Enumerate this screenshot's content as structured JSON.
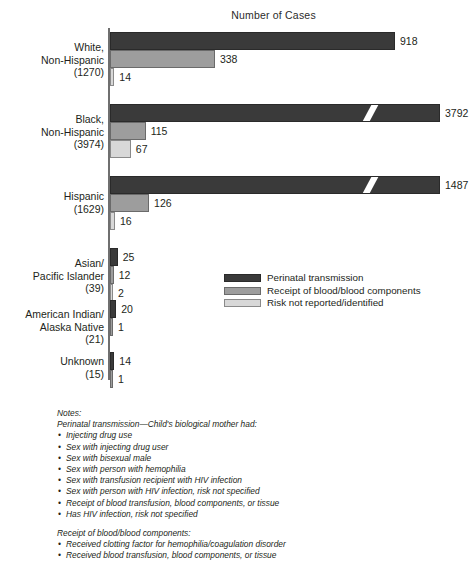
{
  "chart_data": {
    "type": "bar",
    "orientation": "horizontal",
    "title": "Number of Cases",
    "xlabel": "",
    "ylabel": "",
    "grid": false,
    "legend_position": "middle-right",
    "axis_break": true,
    "axis_break_note": "Bars for Black, Non-Hispanic (3792) and Hispanic (1487) perinatal transmission are drawn with a diagonal axis break.",
    "categories": [
      "White,\nNon-Hispanic\n(1270)",
      "Black,\nNon-Hispanic\n(3974)",
      "Hispanic\n(1629)",
      "Asian/\nPacific Islander\n(39)",
      "American Indian/\nAlaska Native\n(21)",
      "Unknown\n(15)"
    ],
    "category_totals": [
      1270,
      3974,
      1629,
      39,
      21,
      15
    ],
    "series": [
      {
        "name": "Perinatal transmission",
        "color": "#3a3a3a",
        "values": [
          918,
          3792,
          1487,
          25,
          20,
          14
        ]
      },
      {
        "name": "Receipt of blood/blood components",
        "color": "#9d9d9d",
        "values": [
          338,
          115,
          126,
          12,
          1,
          1
        ]
      },
      {
        "name": "Risk not reported/identified",
        "color": "#d8d8d8",
        "values": [
          14,
          67,
          16,
          2,
          null,
          null
        ]
      }
    ]
  },
  "legend": {
    "items": [
      {
        "label": "Perinatal transmission",
        "swatch": "s0"
      },
      {
        "label": "Receipt of blood/blood components",
        "swatch": "s1"
      },
      {
        "label": "Risk not reported/identified",
        "swatch": "s2"
      }
    ]
  },
  "notes": {
    "heading": "Notes:",
    "section1_title": "Perinatal transmission—Child's biological mother had:",
    "section1_items": [
      "Injecting drug use",
      "Sex with injecting drug user",
      "Sex with bisexual male",
      "Sex with person with hemophilia",
      "Sex with transfusion recipient with HIV infection",
      "Sex with person with HIV infection, risk not specified",
      "Receipt of blood transfusion, blood components, or tissue",
      "Has HIV infection, risk not specified"
    ],
    "section2_title": "Receipt of blood/blood components:",
    "section2_items": [
      "Received clotting factor for hemophilia/coagulation disorder",
      "Received blood transfusion, blood components, or tissue"
    ]
  }
}
